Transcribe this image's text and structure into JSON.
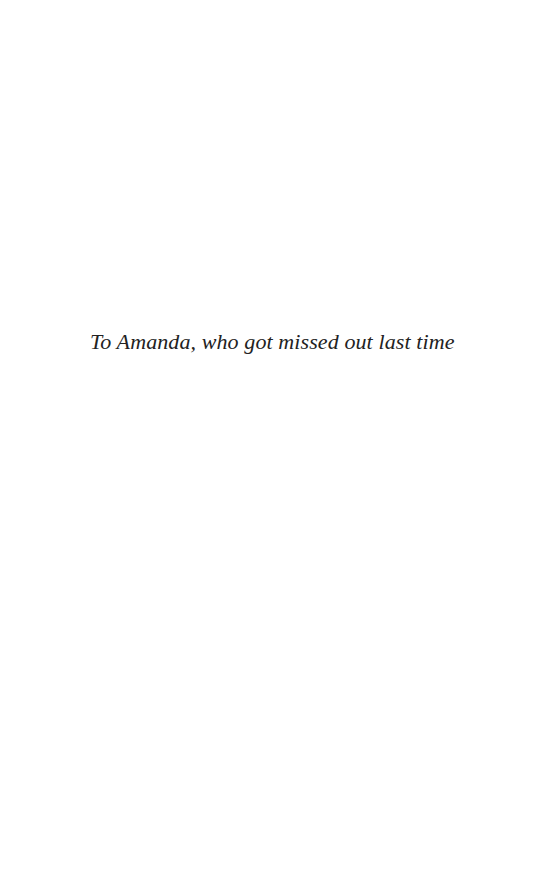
{
  "page": {
    "background": "#ffffff",
    "dedication": "To Amanda, who got missed out last time",
    "text_color": "#222222"
  }
}
